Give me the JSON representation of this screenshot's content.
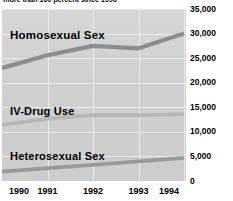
{
  "caption": {
    "text": "more than 100 percent since 1990"
  },
  "chart_data": {
    "type": "line",
    "title": "",
    "subtitle": "",
    "xlabel": "",
    "ylabel": "",
    "categories": [
      "1990",
      "1991",
      "1992",
      "1993",
      "1994"
    ],
    "x_tick_labels": [
      "1990",
      "1991",
      "1992",
      "1993",
      "1994"
    ],
    "y_tick_labels": [
      "0",
      "5,000",
      "10,000",
      "15,000",
      "20,000",
      "25,000",
      "30,000",
      "35,000"
    ],
    "y_tick_values": [
      0,
      5000,
      10000,
      15000,
      20000,
      25000,
      30000,
      35000
    ],
    "ylim": [
      0,
      35000
    ],
    "grid": true,
    "y_axis_position": "right",
    "legend": "inline-labels",
    "plot_background": "#d2d2d2",
    "line_color": "#8a8a8a",
    "series": [
      {
        "name": "Homosexual Sex",
        "label": "Homosexual Sex",
        "values": [
          23000,
          25600,
          27500,
          27000,
          30000
        ]
      },
      {
        "name": "IV-Drug Use",
        "label": "IV-Drug Use",
        "values": [
          11400,
          12700,
          13400,
          13400,
          13600
        ]
      },
      {
        "name": "Heterosexual Sex",
        "label": "Heterosexual Sex",
        "values": [
          1900,
          2600,
          3300,
          4000,
          4700
        ]
      }
    ]
  }
}
